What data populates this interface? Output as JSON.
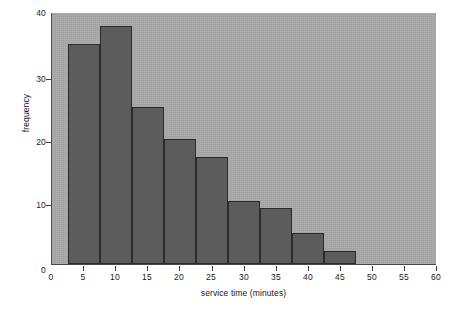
{
  "chart_data": {
    "type": "bar",
    "title": "",
    "subtitle": "",
    "xlabel": "service time (minutes)",
    "ylabel": "frequency",
    "xlim": [
      0,
      60
    ],
    "ylim": [
      0,
      40
    ],
    "xticks": [
      0,
      5,
      10,
      15,
      20,
      25,
      30,
      35,
      40,
      45,
      50,
      55,
      60
    ],
    "yticks": [
      0,
      10,
      20,
      30,
      40
    ],
    "xtick_labels": [
      "0",
      "5",
      "10",
      "15",
      "20",
      "25",
      "30",
      "35",
      "40",
      "45",
      "50",
      "55",
      "60"
    ],
    "ytick_labels": [
      "0",
      "10",
      "20",
      "30",
      "40"
    ],
    "grid": false,
    "legend": null,
    "bin_width": 5,
    "bin_edges": [
      2.5,
      7.5,
      12.5,
      17.5,
      22.5,
      27.5,
      32.5,
      37.5,
      42.5,
      47.5
    ],
    "categories": [
      "2.5-7.5",
      "7.5-12.5",
      "12.5-17.5",
      "17.5-22.5",
      "22.5-27.5",
      "27.5-32.5",
      "32.5-37.5",
      "37.5-42.5",
      "42.5-47.5"
    ],
    "values": [
      35,
      38,
      25,
      20,
      17,
      10,
      9,
      5,
      2
    ],
    "colors": {
      "plot_background": "#a9a9a9",
      "bar_fill": "#5c5c5c",
      "bar_edge": "#2b2b2b",
      "axis": "#4a4a4a",
      "text": "#1a1a1a",
      "page_background": "#ffffff"
    }
  }
}
